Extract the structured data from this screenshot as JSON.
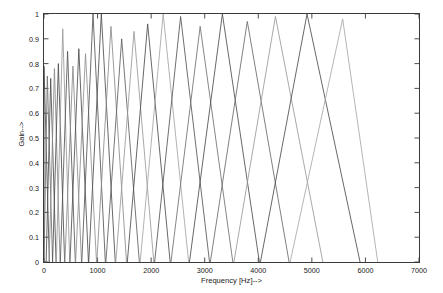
{
  "chart_data": {
    "type": "line",
    "title": "",
    "xlabel": "Frequency [Hz]-->",
    "ylabel": "Gain-->",
    "xlim": [
      0,
      7000
    ],
    "ylim": [
      0,
      1
    ],
    "grid": false,
    "legend": "none",
    "xticks": [
      0,
      1000,
      2000,
      3000,
      4000,
      5000,
      6000,
      7000
    ],
    "xticklabels": [
      "0",
      "1000",
      "2000",
      "3000",
      "4000",
      "5000",
      "6000",
      "7000"
    ],
    "yticks": [
      0,
      0.1,
      0.2,
      0.3,
      0.4,
      0.5,
      0.6,
      0.7,
      0.8,
      0.9,
      1
    ],
    "yticklabels": [
      "0",
      "0.1",
      "0.2",
      "0.3",
      "0.4",
      "0.5",
      "0.6",
      "0.7",
      "0.8",
      "0.9",
      "1"
    ],
    "series": [
      {
        "name": "filter-1",
        "left": 0,
        "peak": 0,
        "right": 100,
        "gain": 0.79,
        "color": "#4d4d4d"
      },
      {
        "name": "filter-2",
        "left": 0,
        "peak": 62,
        "right": 160,
        "gain": 0.75,
        "color": "#707070"
      },
      {
        "name": "filter-3",
        "left": 40,
        "peak": 125,
        "right": 225,
        "gain": 0.74,
        "color": "#4d4d4d"
      },
      {
        "name": "filter-4",
        "left": 95,
        "peak": 195,
        "right": 300,
        "gain": 0.78,
        "color": "#8a8a8a"
      },
      {
        "name": "filter-5",
        "left": 160,
        "peak": 268,
        "right": 385,
        "gain": 0.8,
        "color": "#4d4d4d"
      },
      {
        "name": "filter-6",
        "left": 230,
        "peak": 350,
        "right": 480,
        "gain": 0.94,
        "color": "#9a9a9a"
      },
      {
        "name": "filter-7",
        "left": 305,
        "peak": 440,
        "right": 585,
        "gain": 0.85,
        "color": "#555555"
      },
      {
        "name": "filter-8",
        "left": 390,
        "peak": 540,
        "right": 700,
        "gain": 0.79,
        "color": "#8a8a8a"
      },
      {
        "name": "filter-9",
        "left": 485,
        "peak": 650,
        "right": 830,
        "gain": 0.86,
        "color": "#4d4d4d"
      },
      {
        "name": "filter-10",
        "left": 590,
        "peak": 775,
        "right": 980,
        "gain": 0.84,
        "color": "#909090"
      },
      {
        "name": "filter-11",
        "left": 705,
        "peak": 915,
        "right": 1145,
        "gain": 1.0,
        "color": "#555555"
      },
      {
        "name": "filter-12",
        "left": 835,
        "peak": 1070,
        "right": 1330,
        "gain": 1.0,
        "color": "#4d4d4d"
      },
      {
        "name": "filter-13",
        "left": 985,
        "peak": 1250,
        "right": 1540,
        "gain": 0.95,
        "color": "#8a8a8a"
      },
      {
        "name": "filter-14",
        "left": 1155,
        "peak": 1450,
        "right": 1780,
        "gain": 0.9,
        "color": "#606060"
      },
      {
        "name": "filter-15",
        "left": 1340,
        "peak": 1680,
        "right": 2050,
        "gain": 0.93,
        "color": "#9a9a9a"
      },
      {
        "name": "filter-16",
        "left": 1555,
        "peak": 1935,
        "right": 2355,
        "gain": 0.96,
        "color": "#4d4d4d"
      },
      {
        "name": "filter-17",
        "left": 1795,
        "peak": 2225,
        "right": 2700,
        "gain": 1.0,
        "color": "#a5a5a5"
      },
      {
        "name": "filter-18",
        "left": 2065,
        "peak": 2550,
        "right": 3090,
        "gain": 0.99,
        "color": "#555555"
      },
      {
        "name": "filter-19",
        "left": 2370,
        "peak": 2915,
        "right": 3525,
        "gain": 0.95,
        "color": "#707070"
      },
      {
        "name": "filter-20",
        "left": 2715,
        "peak": 3330,
        "right": 4020,
        "gain": 1.0,
        "color": "#4d4d4d"
      },
      {
        "name": "filter-21",
        "left": 3105,
        "peak": 3795,
        "right": 4575,
        "gain": 0.97,
        "color": "#6a6a6a"
      },
      {
        "name": "filter-22",
        "left": 3545,
        "peak": 4320,
        "right": 5205,
        "gain": 0.99,
        "color": "#9a9a9a"
      },
      {
        "name": "filter-23",
        "left": 4040,
        "peak": 4910,
        "right": 5900,
        "gain": 1.0,
        "color": "#4d4d4d"
      },
      {
        "name": "filter-24",
        "left": 4595,
        "peak": 5575,
        "right": 6230,
        "gain": 0.98,
        "color": "#a8a8a8"
      }
    ]
  },
  "axes": {
    "xlabel": "Frequency [Hz]-->",
    "ylabel": "Gain-->",
    "xticklabels": [
      "0",
      "1000",
      "2000",
      "3000",
      "4000",
      "5000",
      "6000",
      "7000"
    ],
    "yticklabels": [
      "1",
      "0.9",
      "0.8",
      "0.7",
      "0.6",
      "0.5",
      "0.4",
      "0.3",
      "0.2",
      "0.1",
      "0"
    ]
  },
  "colors": {
    "axis": "#3a3a3a",
    "text": "#1a1a1a",
    "background": "#ffffff"
  }
}
